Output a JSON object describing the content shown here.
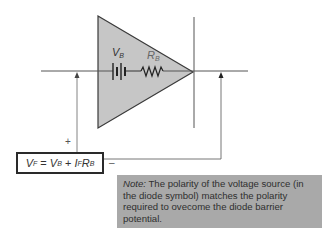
{
  "diagram": {
    "type": "diode equivalent circuit",
    "colors": {
      "triangle_fill": "#c6c6c6",
      "line": "#555555",
      "note_bg": "#a9a9a9"
    },
    "labels": {
      "battery": {
        "main": "V",
        "sub": "B"
      },
      "resistor": {
        "main": "R",
        "sub": "B"
      }
    },
    "formula": {
      "vf": "V",
      "vf_sub": "F",
      "eq": " = ",
      "vb": "V",
      "vb_sub": "B",
      "plus": " + ",
      "if": "I",
      "if_sub": "F",
      "rb": "R",
      "rb_sub": "B"
    },
    "polarity": {
      "plus": "+",
      "minus": "–"
    },
    "note": {
      "label": "Note:",
      "text": " The polarity of the voltage source (in the diode symbol) matches the polarity required to ovecome the diode barrier potential."
    }
  }
}
